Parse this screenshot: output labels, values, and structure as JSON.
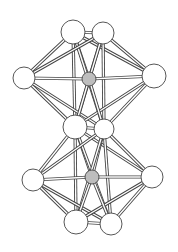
{
  "diagram": {
    "type": "ball-and-stick cluster structure",
    "colors": {
      "background": "#ffffff",
      "atom_outer": "#ffffff",
      "atom_center": "#bdbdbd",
      "stroke": "#444444",
      "bond_fill": "#ffffff"
    },
    "atoms": [
      {
        "id": "a1",
        "x": 73,
        "y": 32,
        "r": 12,
        "kind": "outer"
      },
      {
        "id": "a2",
        "x": 103,
        "y": 33,
        "r": 11,
        "kind": "outer"
      },
      {
        "id": "a3",
        "x": 24,
        "y": 78,
        "r": 11,
        "kind": "outer"
      },
      {
        "id": "a4",
        "x": 154,
        "y": 76,
        "r": 12,
        "kind": "outer"
      },
      {
        "id": "c1",
        "x": 89,
        "y": 79,
        "r": 7,
        "kind": "center"
      },
      {
        "id": "a5",
        "x": 75,
        "y": 127,
        "r": 12,
        "kind": "outer"
      },
      {
        "id": "a6",
        "x": 104,
        "y": 129,
        "r": 10,
        "kind": "outer"
      },
      {
        "id": "a7",
        "x": 33,
        "y": 180,
        "r": 11,
        "kind": "outer"
      },
      {
        "id": "a8",
        "x": 152,
        "y": 177,
        "r": 11,
        "kind": "outer"
      },
      {
        "id": "c2",
        "x": 92,
        "y": 177,
        "r": 7,
        "kind": "center"
      },
      {
        "id": "a9",
        "x": 76,
        "y": 222,
        "r": 12,
        "kind": "outer"
      },
      {
        "id": "a10",
        "x": 111,
        "y": 224,
        "r": 11,
        "kind": "outer"
      }
    ],
    "bonds": [
      [
        "a1",
        "a2"
      ],
      [
        "a1",
        "a3"
      ],
      [
        "a1",
        "a4"
      ],
      [
        "a1",
        "c1"
      ],
      [
        "a1",
        "a5"
      ],
      [
        "a1",
        "a6"
      ],
      [
        "a2",
        "a3"
      ],
      [
        "a2",
        "a4"
      ],
      [
        "a2",
        "c1"
      ],
      [
        "a2",
        "a5"
      ],
      [
        "a2",
        "a6"
      ],
      [
        "a3",
        "c1"
      ],
      [
        "a3",
        "a5"
      ],
      [
        "a3",
        "a6"
      ],
      [
        "a4",
        "c1"
      ],
      [
        "a4",
        "a5"
      ],
      [
        "a4",
        "a6"
      ],
      [
        "c1",
        "a5"
      ],
      [
        "c1",
        "a6"
      ],
      [
        "a5",
        "a6"
      ],
      [
        "a5",
        "a7"
      ],
      [
        "a5",
        "a8"
      ],
      [
        "a5",
        "c2"
      ],
      [
        "a5",
        "a9"
      ],
      [
        "a5",
        "a10"
      ],
      [
        "a6",
        "a7"
      ],
      [
        "a6",
        "a8"
      ],
      [
        "a6",
        "c2"
      ],
      [
        "a6",
        "a9"
      ],
      [
        "a6",
        "a10"
      ],
      [
        "a7",
        "c2"
      ],
      [
        "a7",
        "a9"
      ],
      [
        "a7",
        "a10"
      ],
      [
        "a8",
        "c2"
      ],
      [
        "a8",
        "a9"
      ],
      [
        "a8",
        "a10"
      ],
      [
        "c2",
        "a9"
      ],
      [
        "c2",
        "a10"
      ],
      [
        "a9",
        "a10"
      ]
    ]
  }
}
